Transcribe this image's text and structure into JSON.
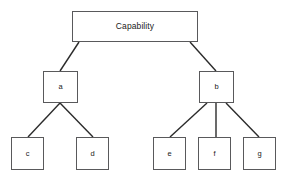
{
  "diagram": {
    "type": "tree",
    "title_text": "Capability",
    "background_color": "#ffffff",
    "box_border_color": "#59595b",
    "edge_color": "#2b2b2b",
    "text_color": "#1a1a1a",
    "nodes": [
      {
        "id": "root",
        "label": "Capability",
        "level": 0,
        "x": 72,
        "y": 11,
        "w": 126,
        "h": 31
      },
      {
        "id": "a",
        "label": "a",
        "level": 1,
        "x": 43,
        "y": 71,
        "w": 35,
        "h": 32
      },
      {
        "id": "b",
        "label": "b",
        "level": 1,
        "x": 199,
        "y": 71,
        "w": 35,
        "h": 32
      },
      {
        "id": "c",
        "label": "c",
        "level": 2,
        "x": 11,
        "y": 137,
        "w": 33,
        "h": 33
      },
      {
        "id": "d",
        "label": "d",
        "level": 2,
        "x": 76,
        "y": 137,
        "w": 33,
        "h": 33
      },
      {
        "id": "e",
        "label": "e",
        "level": 2,
        "x": 153,
        "y": 137,
        "w": 33,
        "h": 33
      },
      {
        "id": "f",
        "label": "f",
        "level": 2,
        "x": 198,
        "y": 137,
        "w": 33,
        "h": 33
      },
      {
        "id": "g",
        "label": "g",
        "level": 2,
        "x": 243,
        "y": 137,
        "w": 33,
        "h": 33
      }
    ],
    "edges": [
      {
        "from": "root",
        "to": "a",
        "x1": 79,
        "y1": 42,
        "x2": 60,
        "y2": 71
      },
      {
        "from": "root",
        "to": "b",
        "x1": 190,
        "y1": 42,
        "x2": 216,
        "y2": 71
      },
      {
        "from": "a",
        "to": "c",
        "x1": 60,
        "y1": 103,
        "x2": 28,
        "y2": 137
      },
      {
        "from": "a",
        "to": "d",
        "x1": 60,
        "y1": 103,
        "x2": 93,
        "y2": 137
      },
      {
        "from": "b",
        "to": "e",
        "x1": 207,
        "y1": 103,
        "x2": 170,
        "y2": 137
      },
      {
        "from": "b",
        "to": "f",
        "x1": 216,
        "y1": 103,
        "x2": 216,
        "y2": 137
      },
      {
        "from": "b",
        "to": "g",
        "x1": 226,
        "y1": 103,
        "x2": 259,
        "y2": 137
      }
    ]
  }
}
